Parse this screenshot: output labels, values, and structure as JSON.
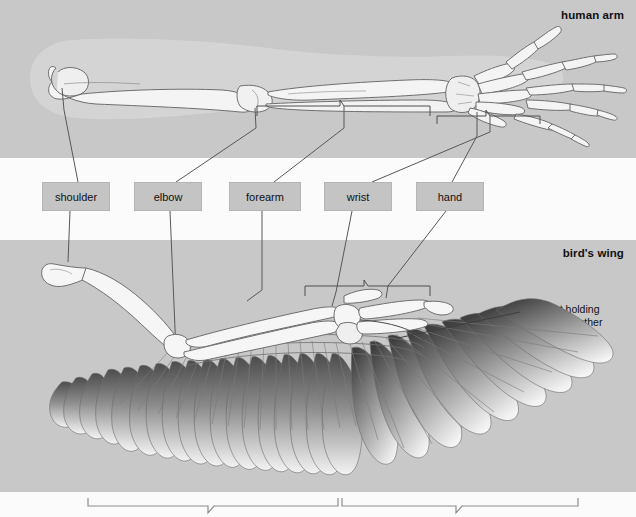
{
  "figure": {
    "kind": "comparative-anatomy-diagram"
  },
  "panels": {
    "arm": {
      "title": "human arm"
    },
    "wing": {
      "title": "bird's wing"
    }
  },
  "labels": [
    {
      "id": "shoulder",
      "text": "shoulder",
      "x": 42,
      "y": 182,
      "w": 68
    },
    {
      "id": "elbow",
      "text": "elbow",
      "x": 134,
      "y": 182,
      "w": 68
    },
    {
      "id": "forearm",
      "text": "forearm",
      "x": 229,
      "y": 182,
      "w": 72
    },
    {
      "id": "wrist",
      "text": "wrist",
      "x": 324,
      "y": 182,
      "w": 68
    },
    {
      "id": "hand",
      "text": "hand",
      "x": 416,
      "y": 182,
      "w": 68
    }
  ],
  "annotations": {
    "ligament": "ligament holding\nfeathers together"
  },
  "colors": {
    "panel_gray": "#c8c8c8",
    "page_white": "#fbfbfb",
    "label_box": "#c4c4c4",
    "bone_fill": "#f4f4f4",
    "bone_stroke": "#6f6f6f",
    "leader_line": "#55585c",
    "text": "#111111",
    "flesh_halo": "#d4d4d4",
    "feather_dark": "#4a4a4a",
    "feather_light": "#f2f2f2"
  },
  "braces": {
    "arm_forearm": {
      "x1": 257,
      "x2": 430,
      "y": 103
    },
    "arm_hand": {
      "x1": 437,
      "x2": 540,
      "y": 114
    },
    "wing_upper": {
      "x1": 305,
      "x2": 430,
      "y": 285
    },
    "bottom_left": {
      "x1": 88,
      "x2": 338,
      "y": 500,
      "text": ""
    },
    "bottom_right": {
      "x1": 342,
      "x2": 578,
      "y": 500,
      "text": ""
    }
  }
}
